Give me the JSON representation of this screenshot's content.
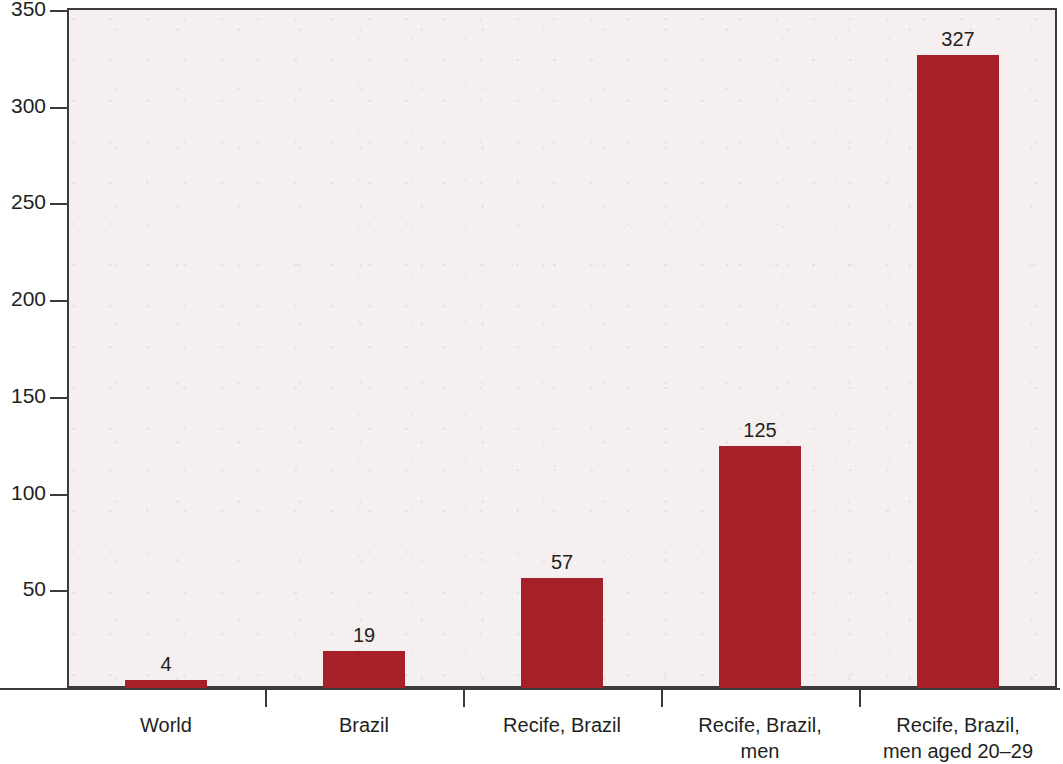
{
  "chart_data": {
    "type": "bar",
    "title": "",
    "subtitle": "",
    "xlabel": "",
    "ylabel": "",
    "categories": [
      "World",
      "Brazil",
      "Recife, Brazil",
      "Recife, Brazil,\nmen",
      "Recife, Brazil,\nmen aged 20–29"
    ],
    "category_lines": [
      [
        "World"
      ],
      [
        "Brazil"
      ],
      [
        "Recife, Brazil"
      ],
      [
        "Recife, Brazil,",
        "men"
      ],
      [
        "Recife, Brazil,",
        "men aged 20–29"
      ]
    ],
    "values": [
      4,
      19,
      57,
      125,
      327
    ],
    "value_labels": [
      "4",
      "19",
      "57",
      "125",
      "327"
    ],
    "ylim": [
      0,
      350
    ],
    "yticks": [
      50,
      100,
      150,
      200,
      250,
      300,
      350
    ],
    "ytick_labels": [
      "50",
      "100",
      "150",
      "200",
      "250",
      "300",
      "350"
    ],
    "grid": false,
    "legend": null,
    "colors": {
      "bar": "#a52028",
      "plot_background": "#f5f0ef",
      "page_background": "#ffffff",
      "axis": "#3b3b3b",
      "text": "#231f20"
    }
  }
}
